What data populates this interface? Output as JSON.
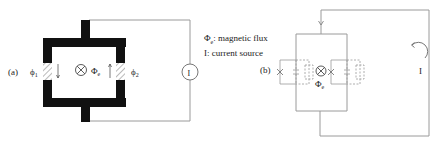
{
  "figure": {
    "panel_a": {
      "label": "(a)",
      "junction_left_label": "ϕ",
      "junction_left_sub": "1",
      "junction_right_label": "ϕ",
      "junction_right_sub": "2",
      "flux_symbol": "Φ",
      "flux_sub": "e",
      "source_label": "I"
    },
    "legend": {
      "line1_symbol": "Φ",
      "line1_sub": "e",
      "line1_text": ": magnetic flux",
      "line2_text": "I: current source"
    },
    "panel_b": {
      "label": "(b)",
      "flux_symbol": "Φ",
      "flux_sub": "e",
      "current_label": "I"
    },
    "colors": {
      "superconductor": "#111111",
      "wire": "#9a9a9a",
      "hatch": "#8a8a8a",
      "text": "#222222"
    }
  }
}
